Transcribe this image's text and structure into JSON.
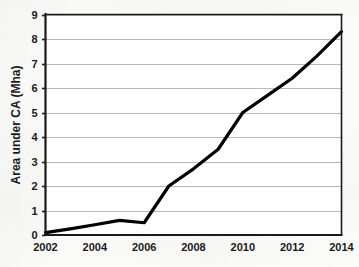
{
  "chart_data": {
    "type": "line",
    "title": "",
    "xlabel": "",
    "ylabel": "Area under CA (Mha)",
    "x": [
      2002,
      2003,
      2004,
      2005,
      2006,
      2007,
      2008,
      2009,
      2010,
      2011,
      2012,
      2013,
      2014
    ],
    "values": [
      0.1,
      0.25,
      0.42,
      0.6,
      0.5,
      2.0,
      2.7,
      3.5,
      5.0,
      5.7,
      6.4,
      7.3,
      8.3
    ],
    "series": [
      {
        "name": "Area under CA",
        "values": [
          0.1,
          0.25,
          0.42,
          0.6,
          0.5,
          2.0,
          2.7,
          3.5,
          5.0,
          5.7,
          6.4,
          7.3,
          8.3
        ]
      }
    ],
    "xlim": [
      2002,
      2014
    ],
    "ylim": [
      0,
      9
    ],
    "xticks": [
      2002,
      2004,
      2006,
      2008,
      2010,
      2012,
      2014
    ],
    "xtick_labels": [
      "2002",
      "2004",
      "2006",
      "2008",
      "2010",
      "2012",
      "2014"
    ],
    "yticks": [
      0,
      1,
      2,
      3,
      4,
      5,
      6,
      7,
      8,
      9
    ],
    "ytick_labels": [
      "0",
      "1",
      "2",
      "3",
      "4",
      "5",
      "6",
      "7",
      "8",
      "9"
    ],
    "grid": "horizontal",
    "legend": "none",
    "line_color": "#000000",
    "grid_color": "#b9b9b9",
    "axis_color": "#1a1a1a",
    "background_color": "#fbfbfa"
  }
}
